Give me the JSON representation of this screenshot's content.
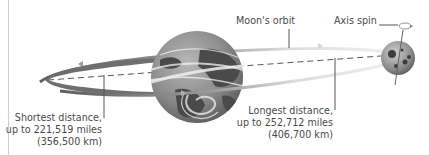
{
  "diagram": {
    "labels": {
      "moon_orbit": "Moon's orbit",
      "axis_spin": "Axis spin",
      "shortest": {
        "line1": "Shortest distance,",
        "line2": "up to 221,519 miles",
        "line3": "(356,500 km)"
      },
      "longest": {
        "line1": "Longest distance,",
        "line2": "up to 252,712 miles",
        "line3": "(406,700 km)"
      }
    },
    "objects": [
      "earth-globe",
      "moon",
      "orbit-ellipse",
      "distance-dashed-line"
    ],
    "colors": {
      "text": "#4a4a4a",
      "orbit_dark": "#6e6e6e",
      "orbit_light": "#e6e6e6",
      "earth_ocean": "#8a8a8a",
      "earth_land": "#4a4a4a",
      "moon": "#9a9a9a"
    }
  }
}
